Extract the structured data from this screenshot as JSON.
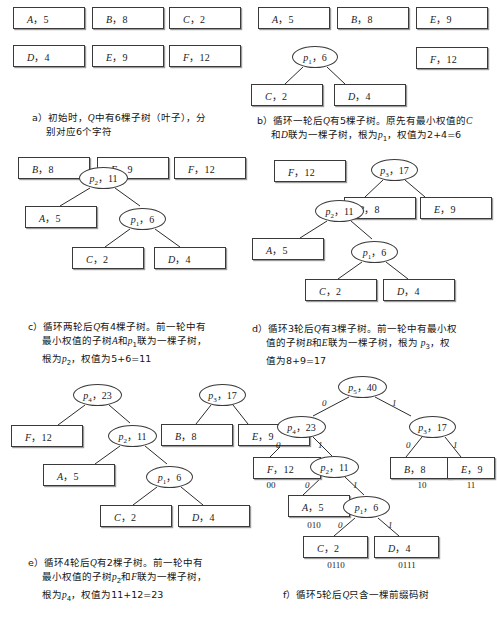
{
  "figure": {
    "panels": [
      {
        "id": "a",
        "caption_lines": [
          "a）初始时，Q中有6棵子树（叶子），分",
          "别对应6个字符"
        ],
        "leaves": [
          {
            "name": "A",
            "weight": "5"
          },
          {
            "name": "B",
            "weight": "8"
          },
          {
            "name": "C",
            "weight": "2"
          },
          {
            "name": "D",
            "weight": "4"
          },
          {
            "name": "E",
            "weight": "9"
          },
          {
            "name": "F",
            "weight": "12"
          }
        ]
      },
      {
        "id": "b",
        "caption_lines": [
          "b）循环一轮后Q有5棵子树。原先有最小权值的C",
          "和D联为一棵子树，根为p₁，权值为2+4=6"
        ],
        "leaves": [
          {
            "name": "A",
            "weight": "5"
          },
          {
            "name": "B",
            "weight": "8"
          },
          {
            "name": "E",
            "weight": "9"
          },
          {
            "name": "F",
            "weight": "12"
          },
          {
            "name": "C",
            "weight": "2"
          },
          {
            "name": "D",
            "weight": "4"
          }
        ],
        "internal": [
          {
            "name": "p",
            "sub": "1",
            "weight": "6"
          }
        ]
      },
      {
        "id": "c",
        "caption_lines": [
          "c）循环两轮后Q有4棵子树。前一轮中有",
          "最小权值的子树A和p₁联为一棵子树，",
          "根为p₂，权值为5+6=11"
        ],
        "leaves": [
          {
            "name": "B",
            "weight": "8"
          },
          {
            "name": "E",
            "weight": "9"
          },
          {
            "name": "F",
            "weight": "12"
          },
          {
            "name": "A",
            "weight": "5"
          },
          {
            "name": "C",
            "weight": "2"
          },
          {
            "name": "D",
            "weight": "4"
          }
        ],
        "internal": [
          {
            "name": "p",
            "sub": "2",
            "weight": "11"
          },
          {
            "name": "p",
            "sub": "1",
            "weight": "6"
          }
        ]
      },
      {
        "id": "d",
        "caption_lines": [
          "d）循环3轮后Q有3棵子树。前一轮中有最小权",
          "值的子树B和E联为一棵子树，根为 p₃，权",
          "值为8+9=17"
        ],
        "leaves": [
          {
            "name": "F",
            "weight": "12"
          },
          {
            "name": "B",
            "weight": "8"
          },
          {
            "name": "E",
            "weight": "9"
          },
          {
            "name": "A",
            "weight": "5"
          },
          {
            "name": "C",
            "weight": "2"
          },
          {
            "name": "D",
            "weight": "4"
          }
        ],
        "internal": [
          {
            "name": "p",
            "sub": "3",
            "weight": "17"
          },
          {
            "name": "p",
            "sub": "2",
            "weight": "11"
          },
          {
            "name": "p",
            "sub": "1",
            "weight": "6"
          }
        ]
      },
      {
        "id": "e",
        "caption_lines": [
          "e）循环4轮后Q有2棵子树。前一轮中有",
          "最小权值的子树p₂和F联为一棵子树，",
          "根为p₄，权值为11+12=23"
        ],
        "leaves": [
          {
            "name": "F",
            "weight": "12"
          },
          {
            "name": "B",
            "weight": "8"
          },
          {
            "name": "E",
            "weight": "9"
          },
          {
            "name": "A",
            "weight": "5"
          },
          {
            "name": "C",
            "weight": "2"
          },
          {
            "name": "D",
            "weight": "4"
          }
        ],
        "internal": [
          {
            "name": "p",
            "sub": "4",
            "weight": "23"
          },
          {
            "name": "p",
            "sub": "3",
            "weight": "17"
          },
          {
            "name": "p",
            "sub": "2",
            "weight": "11"
          },
          {
            "name": "p",
            "sub": "1",
            "weight": "6"
          }
        ]
      },
      {
        "id": "f",
        "caption_lines": [
          "f）循环5轮后Q只含一棵前缀码树"
        ],
        "leaves": [
          {
            "name": "F",
            "weight": "12",
            "code": "00"
          },
          {
            "name": "B",
            "weight": "8",
            "code": "10"
          },
          {
            "name": "E",
            "weight": "9",
            "code": "11"
          },
          {
            "name": "A",
            "weight": "5",
            "code": "010"
          },
          {
            "name": "C",
            "weight": "2",
            "code": "0110"
          },
          {
            "name": "D",
            "weight": "4",
            "code": "0111"
          }
        ],
        "internal": [
          {
            "name": "p",
            "sub": "5",
            "weight": "40"
          },
          {
            "name": "p",
            "sub": "4",
            "weight": "23"
          },
          {
            "name": "p",
            "sub": "3",
            "weight": "17"
          },
          {
            "name": "p",
            "sub": "2",
            "weight": "11"
          },
          {
            "name": "p",
            "sub": "1",
            "weight": "6"
          }
        ],
        "bits": [
          "0",
          "1",
          "0",
          "1",
          "0",
          "1",
          "0",
          "1",
          "0",
          "1"
        ]
      }
    ]
  }
}
